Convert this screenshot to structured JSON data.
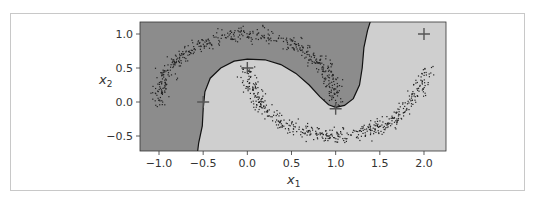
{
  "chart_data": {
    "type": "scatter",
    "title": "",
    "xlabel": "x1",
    "ylabel": "x2",
    "xlim": [
      -1.2,
      2.25
    ],
    "ylim": [
      -0.72,
      1.18
    ],
    "xticks": [
      -1.0,
      -0.5,
      0.0,
      0.5,
      1.0,
      1.5,
      2.0
    ],
    "xtick_labels": [
      "−1.0",
      "−0.5",
      "0.0",
      "0.5",
      "1.0",
      "1.5",
      "2.0"
    ],
    "yticks": [
      -0.5,
      0.0,
      0.5,
      1.0
    ],
    "ytick_labels": [
      "−0.5",
      "0.0",
      "0.5",
      "1.0"
    ],
    "grid": false,
    "legend": null,
    "series": [
      {
        "name": "upper moon",
        "shape": "arc",
        "center": [
          0.0,
          0.0
        ],
        "radius": 1.0,
        "angle_range_deg": [
          0,
          180
        ],
        "noise": 0.05,
        "color": "#222222"
      },
      {
        "name": "lower moon",
        "shape": "arc",
        "center": [
          1.0,
          0.5
        ],
        "radius": 1.0,
        "angle_range_deg": [
          180,
          360
        ],
        "noise": 0.05,
        "color": "#222222"
      }
    ],
    "landmarks": [
      {
        "x": -0.5,
        "y": 0.0
      },
      {
        "x": 0.0,
        "y": 0.5
      },
      {
        "x": 1.0,
        "y": -0.1
      },
      {
        "x": 2.0,
        "y": 1.0
      }
    ],
    "regions": {
      "class0_color": "#8c8c8c",
      "class1_color": "#cfcfcf"
    }
  },
  "labels": {
    "x1_main": "x",
    "x1_sub": "1",
    "x2_main": "x",
    "x2_sub": "2"
  }
}
